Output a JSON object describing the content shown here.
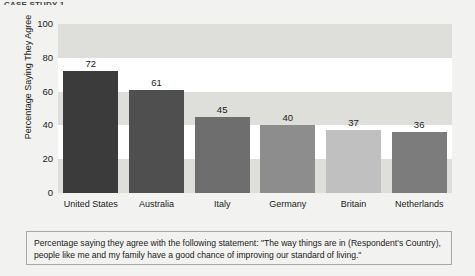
{
  "top_fragment": "CASE STUDY 1",
  "chart_data": {
    "type": "bar",
    "title": "",
    "xlabel": "",
    "ylabel": "Percentage Saying They Agree",
    "ylim": [
      0,
      100
    ],
    "yticks": [
      0,
      20,
      40,
      60,
      80,
      100
    ],
    "ytick_labels": [
      "0",
      "20",
      "40",
      "60",
      "80",
      "100"
    ],
    "grid": "horizontal-bands",
    "legend": "none",
    "categories": [
      "United States",
      "Australia",
      "Italy",
      "Germany",
      "Britain",
      "Netherlands"
    ],
    "values": [
      72,
      61,
      45,
      40,
      37,
      36
    ],
    "value_labels": [
      "72",
      "61",
      "45",
      "40",
      "37",
      "36"
    ],
    "bar_colors": [
      "#3b3b3b",
      "#4f4f4f",
      "#6e6e6e",
      "#8d8d8d",
      "#c0c0c0",
      "#7c7c7c"
    ],
    "plot_background": "#ffffff",
    "band_color": "#dededa"
  },
  "caption": {
    "text": "Percentage saying they agree with the following statement: \"The way things are in (Respondent's Country), people like me and my family have a good chance of improving our standard of living.\""
  }
}
